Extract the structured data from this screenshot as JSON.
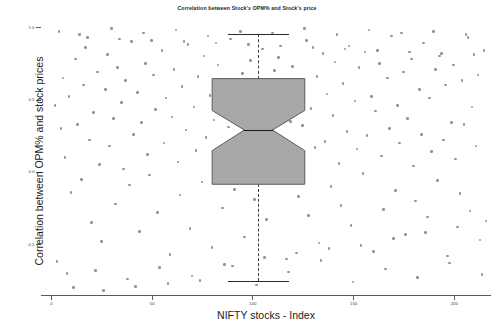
{
  "chart_data": {
    "type": "scatter",
    "title": "Correlation between Stock's OPM% and Stock's price",
    "xlabel": "NIFTY stocks - Index",
    "ylabel": "Correlation between OPM% and stock prices",
    "xlim": [
      -5,
      218
    ],
    "ylim": [
      -0.85,
      1.05
    ],
    "grid": false,
    "legend": null,
    "xticks": [
      {
        "value": 0,
        "label": "0"
      },
      {
        "value": 50,
        "label": "50"
      },
      {
        "value": 100,
        "label": "100"
      },
      {
        "value": 150,
        "label": "150"
      },
      {
        "value": 200,
        "label": "200"
      }
    ],
    "yticks": [
      {
        "value": 1.0,
        "label": "1.0"
      },
      {
        "value": 0.5,
        "label": "0.5"
      },
      {
        "value": 0.0,
        "label": "0.0"
      },
      {
        "value": -0.5,
        "label": "-0.5"
      }
    ],
    "marker_color": "#8d8d97",
    "box_fill_color": "#a8a8a8",
    "box_edge_color": "#5c5c5c",
    "median_color": "#1a1a1a",
    "boxplot": {
      "notched": true,
      "center_x": 103,
      "half_width": 23,
      "notch_half_width": 7,
      "whisker_high": 0.955,
      "q3": 0.645,
      "median": 0.29,
      "q1": -0.085,
      "whisker_low": -0.755,
      "cap_half_width": 15
    },
    "points": [
      [
        2,
        0.46
      ],
      [
        3,
        -0.62
      ],
      [
        5,
        0.3
      ],
      [
        6,
        0.65
      ],
      [
        7,
        0.1
      ],
      [
        9,
        0.52
      ],
      [
        10,
        -0.14
      ],
      [
        12,
        0.78
      ],
      [
        13,
        0.33
      ],
      [
        15,
        -0.05
      ],
      [
        16,
        0.6
      ],
      [
        17,
        0.86
      ],
      [
        19,
        0.22
      ],
      [
        20,
        -0.35
      ],
      [
        21,
        0.41
      ],
      [
        23,
        0.69
      ],
      [
        24,
        0.05
      ],
      [
        25,
        -0.48
      ],
      [
        27,
        0.57
      ],
      [
        28,
        0.81
      ],
      [
        29,
        0.18
      ],
      [
        31,
        0.37
      ],
      [
        32,
        -0.22
      ],
      [
        33,
        0.72
      ],
      [
        35,
        0.48
      ],
      [
        36,
        0.02
      ],
      [
        37,
        0.63
      ],
      [
        39,
        -0.09
      ],
      [
        40,
        0.9
      ],
      [
        41,
        0.26
      ],
      [
        43,
        0.55
      ],
      [
        44,
        -0.41
      ],
      [
        45,
        0.34
      ],
      [
        47,
        0.75
      ],
      [
        48,
        0.12
      ],
      [
        49,
        -0.02
      ],
      [
        51,
        0.67
      ],
      [
        52,
        0.43
      ],
      [
        53,
        -0.28
      ],
      [
        55,
        0.84
      ],
      [
        56,
        0.2
      ],
      [
        57,
        0.51
      ],
      [
        59,
        -0.57
      ],
      [
        60,
        0.38
      ],
      [
        61,
        0.71
      ],
      [
        63,
        0.07
      ],
      [
        64,
        -0.16
      ],
      [
        65,
        0.59
      ],
      [
        67,
        0.29
      ],
      [
        68,
        0.88
      ],
      [
        69,
        -0.39
      ],
      [
        71,
        0.45
      ],
      [
        72,
        0.15
      ],
      [
        73,
        0.66
      ],
      [
        75,
        -0.07
      ],
      [
        76,
        0.8
      ],
      [
        77,
        0.24
      ],
      [
        79,
        0.53
      ],
      [
        80,
        -0.52
      ],
      [
        81,
        0.36
      ],
      [
        83,
        0.74
      ],
      [
        84,
        0.09
      ],
      [
        85,
        -0.25
      ],
      [
        87,
        0.62
      ],
      [
        88,
        0.31
      ],
      [
        89,
        0.92
      ],
      [
        91,
        -0.12
      ],
      [
        92,
        0.47
      ],
      [
        93,
        0.19
      ],
      [
        95,
        0.68
      ],
      [
        96,
        -0.45
      ],
      [
        97,
        0.4
      ],
      [
        99,
        0.77
      ],
      [
        100,
        0.03
      ],
      [
        101,
        -0.19
      ],
      [
        103,
        0.56
      ],
      [
        104,
        0.27
      ],
      [
        105,
        0.85
      ],
      [
        107,
        -0.33
      ],
      [
        108,
        0.5
      ],
      [
        109,
        0.13
      ],
      [
        111,
        0.7
      ],
      [
        112,
        -0.04
      ],
      [
        113,
        0.79
      ],
      [
        115,
        0.23
      ],
      [
        116,
        0.58
      ],
      [
        117,
        -0.6
      ],
      [
        119,
        0.35
      ],
      [
        120,
        0.73
      ],
      [
        121,
        0.08
      ],
      [
        123,
        -0.17
      ],
      [
        124,
        0.64
      ],
      [
        125,
        0.32
      ],
      [
        127,
        0.91
      ],
      [
        128,
        -0.3
      ],
      [
        129,
        0.44
      ],
      [
        131,
        0.17
      ],
      [
        132,
        0.66
      ],
      [
        133,
        -0.49
      ],
      [
        135,
        0.82
      ],
      [
        136,
        0.21
      ],
      [
        137,
        0.54
      ],
      [
        139,
        -0.1
      ],
      [
        140,
        0.39
      ],
      [
        141,
        0.76
      ],
      [
        143,
        0.06
      ],
      [
        144,
        -0.23
      ],
      [
        145,
        0.61
      ],
      [
        147,
        0.28
      ],
      [
        148,
        0.87
      ],
      [
        149,
        -0.37
      ],
      [
        151,
        0.49
      ],
      [
        152,
        0.16
      ],
      [
        153,
        0.72
      ],
      [
        155,
        -0.01
      ],
      [
        156,
        0.83
      ],
      [
        157,
        0.25
      ],
      [
        159,
        0.52
      ],
      [
        160,
        -0.55
      ],
      [
        161,
        0.42
      ],
      [
        163,
        0.75
      ],
      [
        164,
        0.11
      ],
      [
        165,
        -0.26
      ],
      [
        167,
        0.65
      ],
      [
        168,
        0.3
      ],
      [
        169,
        0.94
      ],
      [
        171,
        -0.13
      ],
      [
        172,
        0.46
      ],
      [
        173,
        0.2
      ],
      [
        175,
        0.69
      ],
      [
        176,
        -0.43
      ],
      [
        177,
        0.37
      ],
      [
        179,
        0.78
      ],
      [
        180,
        0.04
      ],
      [
        181,
        -0.2
      ],
      [
        183,
        0.57
      ],
      [
        184,
        0.26
      ],
      [
        185,
        0.89
      ],
      [
        187,
        -0.31
      ],
      [
        188,
        0.51
      ],
      [
        189,
        0.14
      ],
      [
        191,
        0.71
      ],
      [
        192,
        -0.06
      ],
      [
        193,
        0.8
      ],
      [
        195,
        0.22
      ],
      [
        196,
        0.6
      ],
      [
        197,
        -0.58
      ],
      [
        199,
        0.34
      ],
      [
        200,
        0.74
      ],
      [
        201,
        0.09
      ],
      [
        203,
        -0.15
      ],
      [
        204,
        0.63
      ],
      [
        205,
        0.33
      ],
      [
        207,
        0.93
      ],
      [
        208,
        -0.27
      ],
      [
        209,
        0.45
      ],
      [
        211,
        0.18
      ],
      [
        212,
        0.67
      ],
      [
        213,
        -0.47
      ],
      [
        215,
        0.84
      ],
      [
        4,
        0.97
      ],
      [
        8,
        -0.7
      ],
      [
        14,
        0.95
      ],
      [
        22,
        -0.68
      ],
      [
        30,
        0.99
      ],
      [
        38,
        -0.74
      ],
      [
        46,
        0.96
      ],
      [
        54,
        -0.66
      ],
      [
        62,
        0.98
      ],
      [
        70,
        -0.72
      ],
      [
        78,
        0.94
      ],
      [
        86,
        -0.64
      ],
      [
        94,
        0.97
      ],
      [
        102,
        -0.78
      ],
      [
        110,
        0.96
      ],
      [
        118,
        -0.69
      ],
      [
        126,
        0.99
      ],
      [
        134,
        -0.61
      ],
      [
        142,
        0.95
      ],
      [
        150,
        -0.76
      ],
      [
        158,
        0.98
      ],
      [
        166,
        -0.67
      ],
      [
        174,
        0.96
      ],
      [
        182,
        -0.73
      ],
      [
        190,
        0.97
      ],
      [
        198,
        -0.63
      ],
      [
        206,
        0.95
      ],
      [
        214,
        -0.71
      ],
      [
        11,
        -0.8
      ],
      [
        18,
        0.93
      ],
      [
        26,
        -0.82
      ],
      [
        34,
        0.92
      ],
      [
        42,
        -0.79
      ],
      [
        50,
        0.91
      ],
      [
        58,
        -0.77
      ],
      [
        66,
        0.9
      ],
      [
        74,
        -0.75
      ],
      [
        82,
        0.89
      ],
      [
        90,
        -0.65
      ],
      [
        98,
        0.88
      ],
      [
        106,
        -0.59
      ],
      [
        114,
        0.87
      ],
      [
        122,
        -0.56
      ],
      [
        130,
        0.86
      ],
      [
        138,
        -0.53
      ],
      [
        146,
        0.85
      ],
      [
        154,
        -0.51
      ],
      [
        162,
        0.84
      ],
      [
        170,
        -0.46
      ],
      [
        178,
        0.83
      ],
      [
        186,
        -0.42
      ],
      [
        194,
        0.82
      ],
      [
        202,
        -0.38
      ],
      [
        210,
        0.81
      ],
      [
        216,
        -0.34
      ]
    ]
  }
}
